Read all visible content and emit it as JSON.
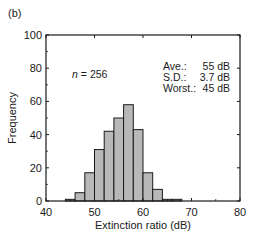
{
  "panel_label": "(b)",
  "annotation": {
    "n_label": "n",
    "n_value": "= 256"
  },
  "stats": {
    "rows": [
      {
        "label": "Ave.:",
        "value": "55 dB"
      },
      {
        "label": "S.D.:",
        "value": "3.7 dB"
      },
      {
        "label": "Worst.:",
        "value": "45 dB"
      }
    ]
  },
  "chart_data": {
    "type": "bar",
    "title": "",
    "xlabel": "Extinction ratio (dB)",
    "ylabel": "Frequency",
    "xlim": [
      40,
      80
    ],
    "ylim": [
      0,
      100
    ],
    "xticks": [
      40,
      50,
      60,
      70,
      80
    ],
    "yticks": [
      0,
      20,
      40,
      60,
      80,
      100
    ],
    "grid": false,
    "bin_width": 2,
    "bins": [
      {
        "start": 44,
        "end": 46,
        "value": 1
      },
      {
        "start": 46,
        "end": 48,
        "value": 5
      },
      {
        "start": 48,
        "end": 50,
        "value": 17
      },
      {
        "start": 50,
        "end": 52,
        "value": 31
      },
      {
        "start": 52,
        "end": 54,
        "value": 42
      },
      {
        "start": 54,
        "end": 56,
        "value": 50
      },
      {
        "start": 56,
        "end": 58,
        "value": 58
      },
      {
        "start": 58,
        "end": 60,
        "value": 43
      },
      {
        "start": 60,
        "end": 62,
        "value": 17
      },
      {
        "start": 62,
        "end": 64,
        "value": 7
      },
      {
        "start": 64,
        "end": 66,
        "value": 1
      },
      {
        "start": 66,
        "end": 68,
        "value": 1
      }
    ],
    "annotations": [
      "n = 256",
      "Ave.: 55 dB",
      "S.D.: 3.7 dB",
      "Worst.: 45 dB"
    ],
    "bar_color": "#b8b8b8",
    "edge_color": "#1a1a1a"
  }
}
